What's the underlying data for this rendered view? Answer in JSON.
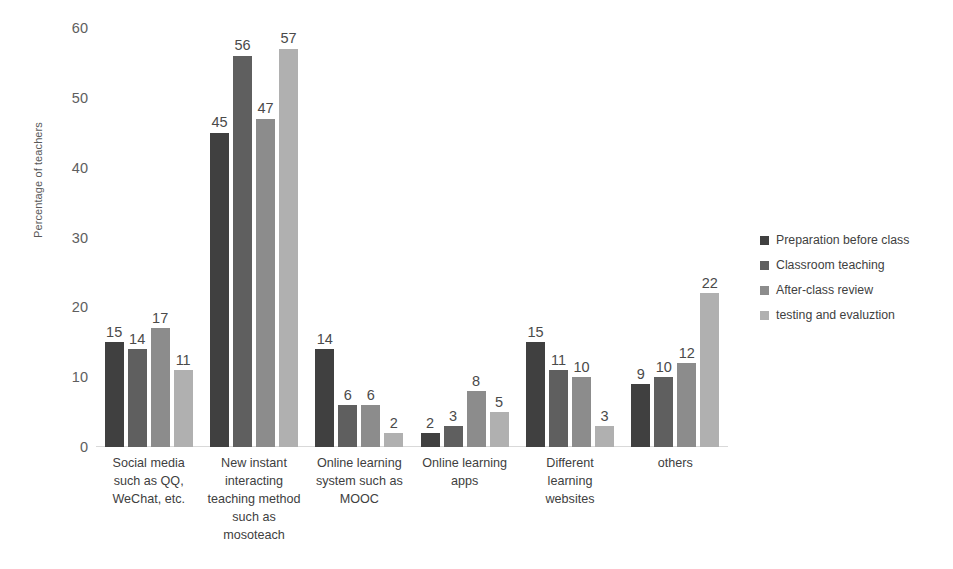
{
  "chart_data": {
    "type": "bar",
    "title": "",
    "subtitle": "",
    "xlabel": "",
    "ylabel": "Percentage of teachers",
    "ylim": [
      0,
      60
    ],
    "yticks": [
      0,
      10,
      20,
      30,
      40,
      50,
      60
    ],
    "ytick_labels": [
      "0",
      "10",
      "20",
      "30",
      "40",
      "50",
      "60"
    ],
    "grid": false,
    "legend_position": "right",
    "bar_label_format": "integer",
    "categories": [
      "Social media such as QQ, WeChat, etc.",
      "New instant interacting teaching method such as mosoteach",
      "Online learning system such as MOOC",
      "Online learning apps",
      "Different learning websites",
      "others"
    ],
    "series": [
      {
        "name": "Preparation before class",
        "color": "#404040",
        "values": [
          15,
          45,
          14,
          2,
          15,
          9
        ]
      },
      {
        "name": "Classroom teaching",
        "color": "#5f5f5f",
        "values": [
          14,
          56,
          6,
          3,
          11,
          10
        ]
      },
      {
        "name": "After-class review",
        "color": "#8c8c8c",
        "values": [
          17,
          47,
          6,
          8,
          10,
          12
        ]
      },
      {
        "name": "testing and evaluztion",
        "color": "#b0b0b0",
        "values": [
          11,
          57,
          2,
          5,
          3,
          22
        ]
      }
    ]
  },
  "category_label_lines": [
    [
      "Social media",
      "such as QQ,",
      "WeChat, etc."
    ],
    [
      "New instant",
      "interacting",
      "teaching method",
      "such as",
      "mosoteach"
    ],
    [
      "Online learning",
      "system such as",
      "MOOC"
    ],
    [
      "Online learning",
      "apps"
    ],
    [
      "Different",
      "learning",
      "websites"
    ],
    [
      "others"
    ]
  ],
  "axis": {
    "baseline_color": "#d9d9d9"
  }
}
